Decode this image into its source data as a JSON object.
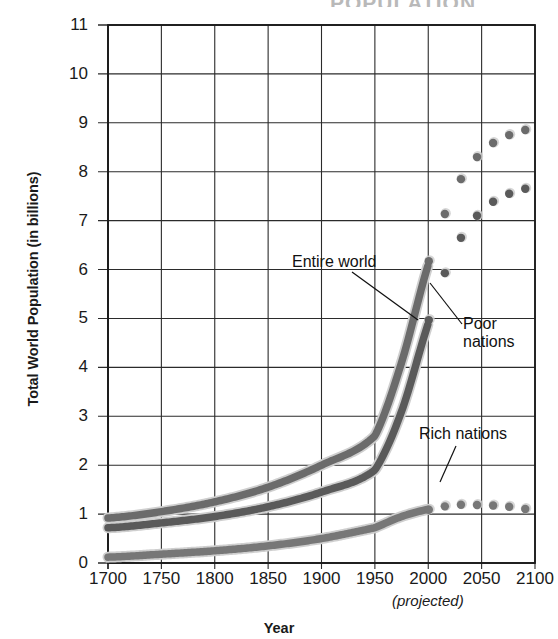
{
  "figure": {
    "title_remnant": "POPULATION",
    "xlabel": "Year",
    "ylabel": "Total World Population (in billions)",
    "projected_note": "(projected)"
  },
  "annotations": {
    "entire_world": "Entire world",
    "poor_nations": "Poor\nnations",
    "rich_nations": "Rich nations"
  },
  "colors": {
    "entire_world": "#6b6b6b",
    "poor_nations": "#5a5a5a",
    "rich_nations": "#777777",
    "axis": "#1a1a1a",
    "grid": "#2b2b2b",
    "highlight": "#cfcfcf"
  },
  "chart_data": {
    "type": "line",
    "title": "Total World Population",
    "xlabel": "Year",
    "ylabel": "Total World Population (in billions)",
    "xlim": [
      1700,
      2100
    ],
    "ylim": [
      0,
      11
    ],
    "xticks": [
      1700,
      1750,
      1800,
      1850,
      1900,
      1950,
      2000,
      2050,
      2100
    ],
    "yticks": [
      0,
      1,
      2,
      3,
      4,
      5,
      6,
      7,
      8,
      9,
      10,
      11
    ],
    "grid": true,
    "legend": "inline-annotations",
    "projection_starts": 2000,
    "x": [
      1700,
      1750,
      1800,
      1850,
      1900,
      1950,
      1975,
      2000,
      2025,
      2050,
      2075,
      2100
    ],
    "series": [
      {
        "name": "Entire world",
        "values": [
          0.92,
          1.05,
          1.25,
          1.55,
          2.0,
          2.6,
          4.1,
          6.1,
          7.6,
          8.4,
          8.75,
          8.9
        ],
        "style": "solid-then-dotted",
        "color": "#6b6b6b"
      },
      {
        "name": "Poor nations",
        "values": [
          0.72,
          0.82,
          0.95,
          1.15,
          1.45,
          1.9,
          3.1,
          4.9,
          6.4,
          7.2,
          7.55,
          7.7
        ],
        "style": "solid-then-dotted",
        "color": "#5a5a5a"
      },
      {
        "name": "Rich nations",
        "values": [
          0.12,
          0.18,
          0.25,
          0.35,
          0.5,
          0.72,
          0.95,
          1.1,
          1.2,
          1.2,
          1.17,
          1.1
        ],
        "style": "solid-then-dotted",
        "color": "#777777"
      }
    ]
  }
}
